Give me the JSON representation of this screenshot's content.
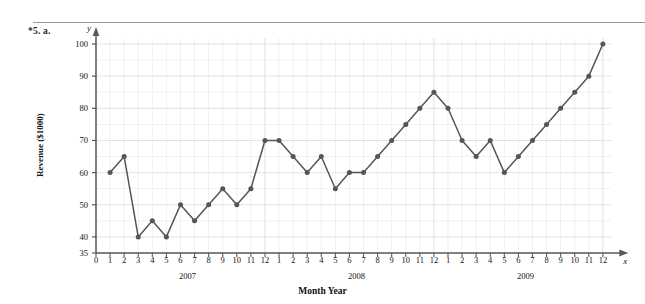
{
  "problem": {
    "label": "*5. a."
  },
  "figure": {
    "y_axis_symbol": "y",
    "x_axis_symbol": "x"
  },
  "chart_data": {
    "type": "line",
    "title": "",
    "xlabel": "Month Year",
    "ylabel": "Revenue ($1000)",
    "ylim": [
      35,
      100
    ],
    "yticks": [
      35,
      40,
      50,
      60,
      70,
      80,
      90,
      100
    ],
    "grid": true,
    "grid_minor_step": 5,
    "legend": null,
    "marker": "circle",
    "line_color": "#555555",
    "marker_color": "#555555",
    "grid_color": "#d8d8e4",
    "axis_color": "#5a5a5a",
    "x_origin_label": "0",
    "xticks": [
      "0",
      "1",
      "2",
      "3",
      "4",
      "5",
      "6",
      "7",
      "8",
      "9",
      "10",
      "11",
      "12",
      "1",
      "2",
      "3",
      "4",
      "5",
      "6",
      "7",
      "8",
      "9",
      "10",
      "11",
      "12",
      "1",
      "2",
      "3",
      "4",
      "5",
      "6",
      "7",
      "8",
      "9",
      "10",
      "11",
      "12"
    ],
    "year_groups": [
      {
        "label": "2007",
        "center_index": 6
      },
      {
        "label": "2008",
        "center_index": 18
      },
      {
        "label": "2009",
        "center_index": 30
      }
    ],
    "x": [
      1,
      2,
      3,
      4,
      5,
      6,
      7,
      8,
      9,
      10,
      11,
      12,
      13,
      14,
      15,
      16,
      17,
      18,
      19,
      20,
      21,
      22,
      23,
      24,
      25,
      26,
      27,
      28,
      29,
      30,
      31,
      32,
      33,
      34,
      35,
      36
    ],
    "values": [
      60,
      65,
      40,
      45,
      40,
      50,
      45,
      50,
      55,
      50,
      55,
      70,
      70,
      65,
      60,
      65,
      55,
      60,
      60,
      65,
      70,
      75,
      80,
      85,
      80,
      70,
      65,
      70,
      60,
      65,
      70,
      75,
      80,
      85,
      90,
      100
    ],
    "point_labels": [
      "2007-1",
      "2007-2",
      "2007-3",
      "2007-4",
      "2007-5",
      "2007-6",
      "2007-7",
      "2007-8",
      "2007-9",
      "2007-10",
      "2007-11",
      "2007-12",
      "2008-1",
      "2008-2",
      "2008-3",
      "2008-4",
      "2008-5",
      "2008-6",
      "2008-7",
      "2008-8",
      "2008-9",
      "2008-10",
      "2008-11",
      "2008-12",
      "2009-1",
      "2009-2",
      "2009-3",
      "2009-4",
      "2009-5",
      "2009-6",
      "2009-7",
      "2009-8",
      "2009-9",
      "2009-10",
      "2009-11",
      "2009-12"
    ]
  }
}
